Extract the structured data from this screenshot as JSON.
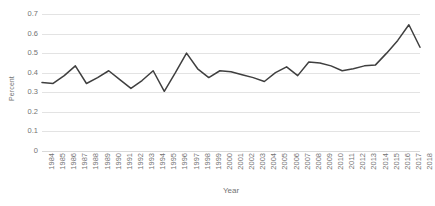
{
  "chart_data": {
    "type": "line",
    "title": "",
    "xlabel": "Year",
    "ylabel": "Percent",
    "grid": true,
    "legend": false,
    "legend_position": "none",
    "line_color": "#3f3f3f",
    "line_width": 1.5,
    "markers": false,
    "xlim": [
      1984,
      2018
    ],
    "ylim": [
      0,
      0.7
    ],
    "ytick_labels": [
      "0.7",
      "0.6",
      "0.5",
      "0.4",
      "0.3",
      "0.2",
      "0.1",
      "0"
    ],
    "ytick_values": [
      0.7,
      0.6,
      0.5,
      0.4,
      0.3,
      0.2,
      0.1,
      0
    ],
    "categories": [
      "1984",
      "1985",
      "1986",
      "1987",
      "1988",
      "1989",
      "1990",
      "1991",
      "1992",
      "1993",
      "1994",
      "1995",
      "1996",
      "1997",
      "1998",
      "1999",
      "2000",
      "2001",
      "2002",
      "2003",
      "2004",
      "2005",
      "2006",
      "2007",
      "2008",
      "2009",
      "2010",
      "2011",
      "2012",
      "2013",
      "2014",
      "2015",
      "2016",
      "2017",
      "2018"
    ],
    "values": [
      0.35,
      0.345,
      0.385,
      0.435,
      0.345,
      0.375,
      0.41,
      0.365,
      0.32,
      0.36,
      0.41,
      0.305,
      0.4,
      0.5,
      0.42,
      0.375,
      0.41,
      0.405,
      0.39,
      0.375,
      0.355,
      0.4,
      0.43,
      0.385,
      0.455,
      0.45,
      0.435,
      0.41,
      0.42,
      0.435,
      0.44,
      0.5,
      0.565,
      0.645,
      0.53
    ],
    "ylabel_unit": "Percent"
  },
  "axes": {
    "y_title": "Percent",
    "x_title": "Year"
  }
}
